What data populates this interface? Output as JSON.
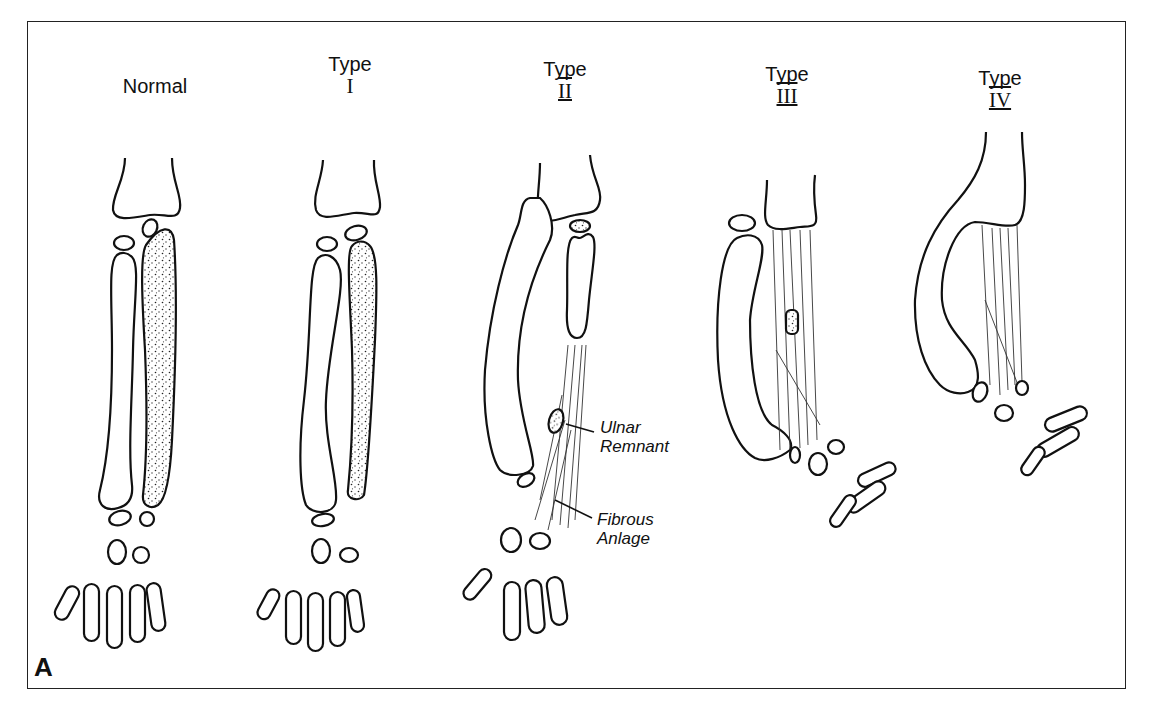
{
  "figure": {
    "panel_letter": "A",
    "panels": [
      {
        "id": "normal",
        "title_line1": "Normal",
        "title_line2": ""
      },
      {
        "id": "type-1",
        "title_line1": "Type",
        "title_line2": "I"
      },
      {
        "id": "type-2",
        "title_line1": "Type",
        "title_line2": "II"
      },
      {
        "id": "type-3",
        "title_line1": "Type",
        "title_line2": "III"
      },
      {
        "id": "type-4",
        "title_line1": "Type",
        "title_line2": "IV"
      }
    ],
    "callouts": [
      {
        "id": "ulnar-remnant",
        "line1": "Ulnar",
        "line2": "Remnant"
      },
      {
        "id": "fibrous-anlage",
        "line1": "Fibrous",
        "line2": "Anlage"
      }
    ],
    "colors": {
      "ink": "#111111",
      "background": "#ffffff",
      "frame": "#222222"
    }
  }
}
